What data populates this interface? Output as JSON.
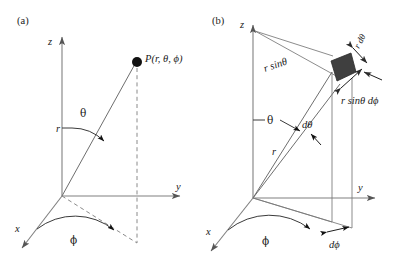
{
  "figure": {
    "background_color": "#ffffff",
    "width": 395,
    "height": 265
  },
  "panels": [
    {
      "id": "a",
      "label": "(a)",
      "description": "Spherical coordinates of a point P",
      "axes": [
        {
          "name": "z-axis",
          "label": "z"
        },
        {
          "name": "y-axis",
          "label": "y"
        },
        {
          "name": "x-axis",
          "label": "x"
        }
      ],
      "labels": {
        "point": "P(r, θ, ϕ)",
        "radius": "r",
        "polar_angle": "θ",
        "azimuthal_angle": "ϕ"
      }
    },
    {
      "id": "b",
      "label": "(b)",
      "description": "Differential volume element in spherical coordinates",
      "axes": [
        {
          "name": "z-axis",
          "label": "z"
        },
        {
          "name": "y-axis",
          "label": "y"
        },
        {
          "name": "x-axis",
          "label": "x"
        }
      ],
      "labels": {
        "projection_radius": "r sinθ",
        "radius": "r",
        "polar_angle": "θ",
        "azimuthal_angle": "ϕ",
        "d_theta": "dθ",
        "d_phi": "dϕ",
        "arc_theta_side": "r dθ",
        "arc_phi_side": "r sinθ dϕ"
      }
    }
  ],
  "colors": {
    "axis": "#808080",
    "ray": "#6e6e6e",
    "arc": "#3a3a3a",
    "dashed": "#8a8a8a",
    "patch_fill": "#3f3f3f",
    "text": "#1a1a1a",
    "background": "#ffffff"
  }
}
